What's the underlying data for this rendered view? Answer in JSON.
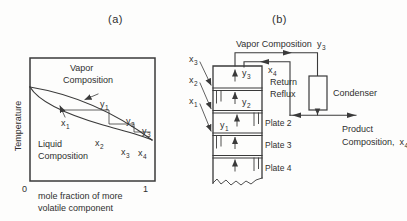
{
  "colors": {
    "ink": "#3a3a3a",
    "paper": "#fdfdfc"
  },
  "panel_a": {
    "title": "(a)",
    "y_axis_label": "Temperature",
    "x_tick_left": "0",
    "x_tick_right": "1",
    "x_axis_caption": [
      "mole fraction of more",
      "volatile component"
    ],
    "vapor_region": [
      "Vapor",
      "Composition"
    ],
    "liquid_region": [
      "Liquid",
      "Composition"
    ],
    "points": {
      "y1": {
        "base": "y",
        "sub": "1"
      },
      "y2": {
        "base": "y",
        "sub": "2"
      },
      "y3": {
        "base": "y",
        "sub": "3"
      },
      "x1": {
        "base": "x",
        "sub": "1"
      },
      "x2": {
        "base": "x",
        "sub": "2"
      },
      "x3": {
        "base": "x",
        "sub": "3"
      },
      "x4": {
        "base": "x",
        "sub": "4"
      }
    }
  },
  "panel_b": {
    "title": "(b)",
    "top_stream_label": "Vapor Composition",
    "top_stream_point": {
      "base": "y",
      "sub": "3"
    },
    "return_reflux": [
      "Return",
      "Reflux"
    ],
    "reflux_point": {
      "base": "x",
      "sub": "4"
    },
    "condenser_label": "Condenser",
    "product_label": "Product",
    "product_composition_label": "Composition,",
    "product_point": {
      "base": "x",
      "sub": "4"
    },
    "plate_labels": [
      "Plate 2",
      "Plate 3",
      "Plate 4"
    ],
    "column_points": {
      "y3": {
        "base": "y",
        "sub": "3"
      },
      "y2": {
        "base": "y",
        "sub": "2"
      },
      "y1": {
        "base": "y",
        "sub": "1"
      }
    },
    "feed_points": {
      "x3": {
        "base": "x",
        "sub": "3"
      },
      "x2": {
        "base": "x",
        "sub": "2"
      },
      "x1": {
        "base": "x",
        "sub": "1"
      }
    }
  }
}
